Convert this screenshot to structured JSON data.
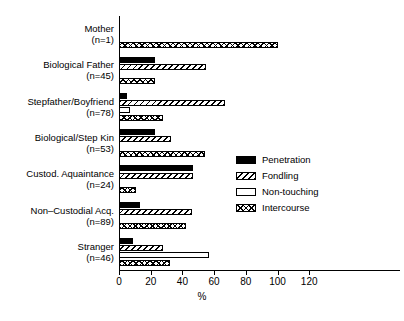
{
  "chart_data": {
    "type": "bar",
    "orientation": "horizontal",
    "grouped": true,
    "title": "",
    "xlabel": "%",
    "ylabel": "",
    "xlim": [
      0,
      130
    ],
    "xticks": [
      0,
      20,
      40,
      60,
      80,
      100,
      120
    ],
    "grid": false,
    "legend_position": "center-right",
    "categories": [
      {
        "name": "Mother",
        "n": "(n=1)"
      },
      {
        "name": "Biological Father",
        "n": "(n=45)"
      },
      {
        "name": "Stepfather/Boyfriend",
        "n": "(n=78)"
      },
      {
        "name": "Biological/Step Kin",
        "n": "(n=53)"
      },
      {
        "name": "Custod. Aquaintance",
        "n": "(n=24)"
      },
      {
        "name": "Non–Custodial Acq.",
        "n": "(n=89)"
      },
      {
        "name": "Stranger",
        "n": "(n=46)"
      }
    ],
    "series": [
      {
        "name": "Penetration",
        "pattern": "solid-black",
        "values": [
          0,
          23,
          5,
          23,
          47,
          13,
          9
        ]
      },
      {
        "name": "Fondling",
        "pattern": "diagonal-hatch",
        "values": [
          0,
          55,
          67,
          33,
          47,
          46,
          28
        ]
      },
      {
        "name": "Non-touching",
        "pattern": "white-empty",
        "values": [
          0,
          0,
          7,
          0,
          0,
          0,
          57
        ]
      },
      {
        "name": "Intercourse",
        "pattern": "cross-hatch",
        "values": [
          100,
          23,
          28,
          54,
          11,
          42,
          32
        ]
      }
    ]
  },
  "legend": {
    "items": [
      {
        "label": "Penetration"
      },
      {
        "label": "Fondling"
      },
      {
        "label": "Non-touching"
      },
      {
        "label": "Intercourse"
      }
    ]
  },
  "axis": {
    "x_title": "%",
    "tick_labels": [
      "0",
      "20",
      "40",
      "60",
      "80",
      "100",
      "120"
    ]
  }
}
